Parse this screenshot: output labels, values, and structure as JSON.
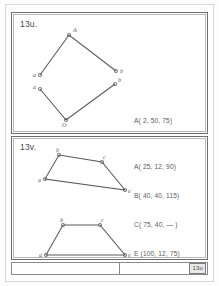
{
  "document": {
    "kind": "scanned-worksheet-page",
    "background_color": "#ffffff",
    "ink_color": "#5a5a5a"
  },
  "panels": [
    {
      "id": "panel-top",
      "tag": "13u.",
      "coordinates": [
        "A( 2, 50, 75)",
        "B( 90, 65, 75)",
        "O( 40, 25, 115)"
      ],
      "figures": [
        {
          "name": "upper-quadrilateral-top-edge",
          "vertices": [
            {
              "label": "a",
              "x": 28,
              "y": 62
            },
            {
              "label": "A",
              "x": 57,
              "y": 22
            },
            {
              "label": "b",
              "x": 104,
              "y": 58
            }
          ]
        },
        {
          "name": "upper-quadrilateral-bottom-edge",
          "vertices": [
            {
              "label": "a",
              "x": 28,
              "y": 76
            },
            {
              "label": "O",
              "x": 54,
              "y": 107
            },
            {
              "label": "b",
              "x": 103,
              "y": 71
            }
          ]
        }
      ]
    },
    {
      "id": "panel-bottom",
      "tag": "13v.",
      "coordinates": [
        "A( 25, 12, 90)",
        "B( 40, 40, 115)",
        "C( 75, 40, — )",
        "E (100, 12, 75)"
      ],
      "figures": [
        {
          "name": "slanted-quadrilateral",
          "vertices": [
            {
              "label": "b",
              "x": 47,
              "y": 18
            },
            {
              "label": "c",
              "x": 90,
              "y": 25
            },
            {
              "label": "e",
              "x": 113,
              "y": 53
            },
            {
              "label": "a",
              "x": 33,
              "y": 42
            }
          ]
        },
        {
          "name": "trapezoid",
          "vertices": [
            {
              "label": "b",
              "x": 51,
              "y": 88
            },
            {
              "label": "c",
              "x": 88,
              "y": 88
            },
            {
              "label": "e",
              "x": 113,
              "y": 118
            },
            {
              "label": "a",
              "x": 34,
              "y": 118
            }
          ]
        }
      ]
    }
  ],
  "bottom_bar": {
    "left_cell_label": "",
    "stamp_label": "13u"
  }
}
